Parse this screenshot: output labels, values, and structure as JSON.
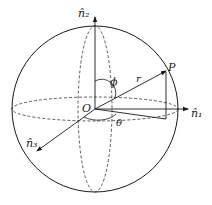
{
  "diagram": {
    "labels": {
      "n1": "n̂₁",
      "n2": "n̂₂",
      "n3": "n̂₃",
      "origin": "O",
      "point": "P",
      "radius": "r",
      "phi": "ϕ",
      "theta": "θ"
    },
    "colors": {
      "stroke": "#1a1a1a",
      "background": "#ffffff"
    }
  }
}
